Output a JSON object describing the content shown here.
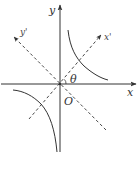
{
  "diagram": {
    "type": "hyperbola-rotated-axes",
    "labels": {
      "x_axis": "x",
      "y_axis": "y",
      "x_prime_axis": "x'",
      "y_prime_axis": "y'",
      "angle": "θ",
      "origin": "O"
    },
    "colors": {
      "line": "#333333",
      "background": "#ffffff"
    }
  }
}
